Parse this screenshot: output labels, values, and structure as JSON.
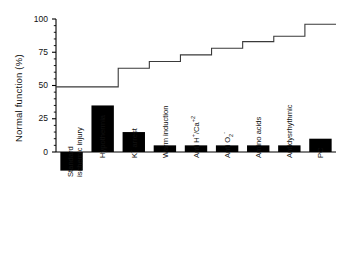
{
  "chart_data": {
    "type": "bar",
    "title": "",
    "xlabel": "",
    "ylabel": "Normal function (%)",
    "ylim": [
      -25,
      100
    ],
    "yticks": [
      0,
      25,
      50,
      75,
      100
    ],
    "ytick_labels": [
      "0",
      "25",
      "50",
      "75",
      "100"
    ],
    "grid": false,
    "legend": "none",
    "categories": [
      "Standard ischemic injury",
      "Hypothermia",
      "K+ arrest",
      "Warm induction",
      "Anti H+/Ca+2",
      "Anti O2-",
      "Amino acids",
      "Antidysrhythmic",
      "PC"
    ],
    "category_labels_html": [
      [
        "Standard",
        "ischemic injury"
      ],
      [
        "Hypothermia"
      ],
      [
        "K<sup>+</sup> arrest"
      ],
      [
        "Warm induction"
      ],
      [
        "Anti H<sup>+</sup>/Ca<sup>+2</sup>"
      ],
      [
        "Anti O<sub>2</sub><sup>-</sup>"
      ],
      [
        "Amino acids"
      ],
      [
        "Antidysrhythmic"
      ],
      [
        "PC"
      ]
    ],
    "series": [
      {
        "name": "Incremental contribution",
        "type": "bar",
        "values": [
          -14,
          35,
          15,
          5,
          5,
          5,
          5,
          5,
          10
        ],
        "color": "#000000"
      },
      {
        "name": "Cumulative normal function",
        "type": "step",
        "values": [
          49,
          49,
          63,
          68,
          73,
          78,
          83,
          87,
          96
        ],
        "color": "#3a3a3a"
      }
    ]
  }
}
